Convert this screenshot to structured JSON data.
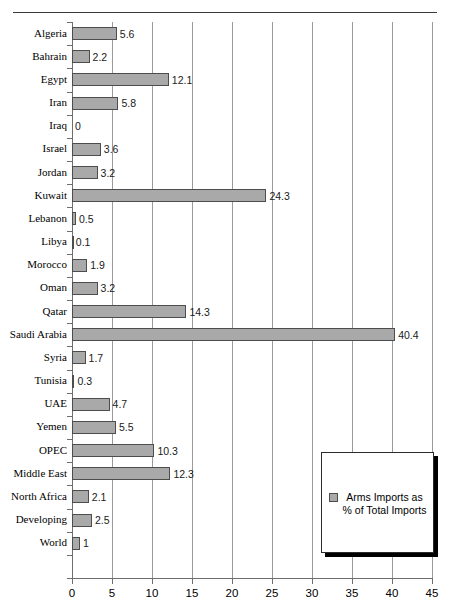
{
  "chart_data": {
    "type": "bar",
    "orientation": "horizontal",
    "title": "",
    "xlabel": "",
    "ylabel": "",
    "xlim": [
      0,
      45
    ],
    "xticks": [
      0,
      5,
      10,
      15,
      20,
      25,
      30,
      35,
      40,
      45
    ],
    "grid": "vertical",
    "legend_position": "bottom-right",
    "series_name": "Arms Imports as % of Total Imports",
    "bar_color": "#a9a9a9",
    "bar_border_color": "#4d4d4d",
    "categories": [
      "Algeria",
      "Bahrain",
      "Egypt",
      "Iran",
      "Iraq",
      "Israel",
      "Jordan",
      "Kuwait",
      "Lebanon",
      "Libya",
      "Morocco",
      "Oman",
      "Qatar",
      "Saudi Arabia",
      "Syria",
      "Tunisia",
      "UAE",
      "Yemen",
      "OPEC",
      "Middle East",
      "North Africa",
      "Developing",
      "World"
    ],
    "values": [
      5.6,
      2.2,
      12.1,
      5.8,
      0,
      3.6,
      3.2,
      24.3,
      0.5,
      0.1,
      1.9,
      3.2,
      14.3,
      40.4,
      1.7,
      0.3,
      4.7,
      5.5,
      10.3,
      12.3,
      2.1,
      2.5,
      1
    ],
    "value_labels": [
      "5.6",
      "2.2",
      "12.1",
      "5.8",
      "0",
      "3.6",
      "3.2",
      "24.3",
      "0.5",
      "0.1",
      "1.9",
      "3.2",
      "14.3",
      "40.4",
      "1.7",
      "0.3",
      "4.7",
      "5.5",
      "10.3",
      "12.3",
      "2.1",
      "2.5",
      "1"
    ]
  },
  "legend": {
    "label": "Arms Imports as % of Total Imports"
  }
}
